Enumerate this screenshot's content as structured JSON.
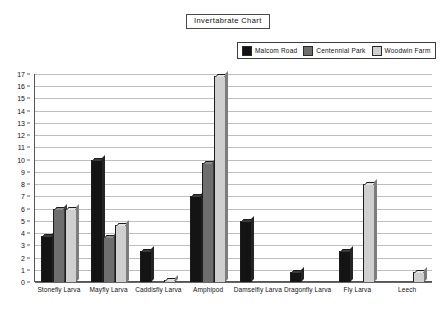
{
  "title": "Invertabrate  Chart",
  "legend": {
    "position": "top-right",
    "entries": [
      {
        "label": "Malcom Road",
        "color": "#141414"
      },
      {
        "label": "Centennial Park",
        "color": "#6e6e6e"
      },
      {
        "label": "Woodwin Farm",
        "color": "#cfcfcf"
      }
    ]
  },
  "chart_data": {
    "type": "bar",
    "title": "Invertabrate  Chart",
    "xlabel": "",
    "ylabel": "",
    "ylim": [
      0,
      17
    ],
    "grid": true,
    "legend_position": "top-right",
    "categories": [
      "Stonefly Larva",
      "Mayfly Larva",
      "Caddisfly Larva",
      "Amphipod",
      "Damselfly Larva",
      "Dragonfly Larva",
      "Fly Larva",
      "Leech"
    ],
    "yticks": [
      0,
      1,
      2,
      3,
      4,
      5,
      6,
      7,
      8,
      9,
      10,
      11,
      12,
      13,
      14,
      15,
      16,
      17
    ],
    "series": [
      {
        "name": "Malcom Road",
        "color": "#141414",
        "values": [
          3.8,
          10,
          2.5,
          7,
          5,
          0.8,
          2.5,
          0
        ]
      },
      {
        "name": "Centennial Park",
        "color": "#6e6e6e",
        "values": [
          6,
          3.7,
          0,
          9.7,
          0,
          0,
          0,
          0
        ]
      },
      {
        "name": "Woodwin Farm",
        "color": "#cfcfcf",
        "values": [
          6,
          4.7,
          0.2,
          16.8,
          0,
          0,
          8,
          0.8
        ]
      }
    ]
  }
}
